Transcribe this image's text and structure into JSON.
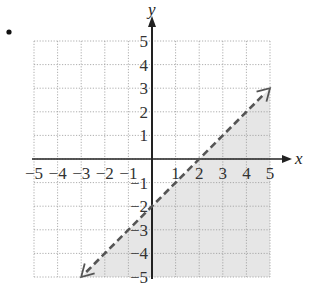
{
  "bullet": "•",
  "chart_data": {
    "type": "line",
    "title": "",
    "xlabel": "x",
    "ylabel": "y",
    "xlim": [
      -5,
      5
    ],
    "ylim": [
      -5,
      5
    ],
    "grid": true,
    "x_ticks": [
      "-5",
      "-4",
      "-3",
      "-2",
      "-1",
      "1",
      "2",
      "3",
      "4",
      "5"
    ],
    "y_ticks": [
      "5",
      "4",
      "3",
      "2",
      "1",
      "-1",
      "-2",
      "-3",
      "-4",
      "-5"
    ],
    "series": [
      {
        "name": "boundary y = x - 2",
        "style": "dashed",
        "arrows": "both",
        "points": [
          [
            -3,
            -5
          ],
          [
            5,
            3
          ]
        ]
      }
    ],
    "shaded_region": {
      "inequality": "y < x - 2",
      "polygon": [
        [
          -3,
          -5
        ],
        [
          5,
          3
        ],
        [
          5,
          -5
        ]
      ],
      "color": "#e8e8e8"
    },
    "colors": {
      "axis": "#222222",
      "grid": "#999999",
      "line": "#555555",
      "shade": "#e6e6e6"
    }
  }
}
